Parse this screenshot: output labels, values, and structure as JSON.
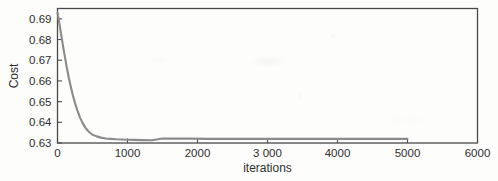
{
  "chart_data": {
    "type": "line",
    "title": "",
    "xlabel": "iterations",
    "ylabel": "Cost",
    "xlim": [
      0,
      6000
    ],
    "ylim": [
      0.63,
      0.695
    ],
    "grid": false,
    "legend": null,
    "xticks": [
      0,
      1000,
      2000,
      3000,
      4000,
      5000,
      6000
    ],
    "xtick_labels": [
      "0",
      "1000",
      "2000",
      "3 000",
      "4000",
      "5000",
      "6000"
    ],
    "yticks": [
      0.63,
      0.64,
      0.65,
      0.66,
      0.67,
      0.68,
      0.69
    ],
    "ytick_labels": [
      "0.63",
      "0.64",
      "0.65",
      "0.66",
      "0.67",
      "0.68",
      "0.69"
    ],
    "series": [
      {
        "name": "cost",
        "color": "#8a8a8a",
        "x": [
          0,
          25,
          50,
          75,
          100,
          130,
          160,
          190,
          220,
          250,
          285,
          320,
          360,
          400,
          450,
          500,
          560,
          620,
          690,
          760,
          840,
          920,
          1000,
          1100,
          1200,
          1350,
          1500,
          1700,
          1900,
          2150,
          2400,
          2700,
          3000,
          3400,
          3800,
          4200,
          4600,
          5000
        ],
        "y": [
          0.6931,
          0.688,
          0.6829,
          0.6777,
          0.6727,
          0.667,
          0.6618,
          0.6572,
          0.653,
          0.6494,
          0.6456,
          0.6424,
          0.6396,
          0.6373,
          0.6353,
          0.634,
          0.6332,
          0.6326,
          0.6322,
          0.632,
          0.6318,
          0.6317,
          0.6316,
          0.6315,
          0.6314,
          0.6313,
          0.6322,
          0.6321,
          0.6321,
          0.632,
          0.632,
          0.632,
          0.632,
          0.632,
          0.632,
          0.632,
          0.632,
          0.632
        ]
      }
    ]
  },
  "axes": {
    "x_title": "iterations",
    "y_title": "Cost"
  },
  "colors": {
    "curve": "#8a8a8a",
    "frame": "#4a4a4a",
    "text": "#2e2e2e",
    "background": "#fdfdfc"
  }
}
